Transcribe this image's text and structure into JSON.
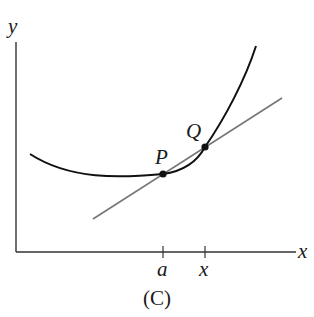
{
  "figure": {
    "caption": "(C)",
    "axes": {
      "x_label": "x",
      "y_label": "y"
    },
    "ticks": [
      {
        "label": "a"
      },
      {
        "label": "x"
      }
    ],
    "points": [
      {
        "label": "P"
      },
      {
        "label": "Q"
      }
    ],
    "elements": {
      "curve": "convex curve y = f(x)",
      "secant": "line through P and Q"
    },
    "colors": {
      "curve": "#111111",
      "secant": "#777777",
      "axes": "#333333",
      "points": "#111111"
    }
  }
}
